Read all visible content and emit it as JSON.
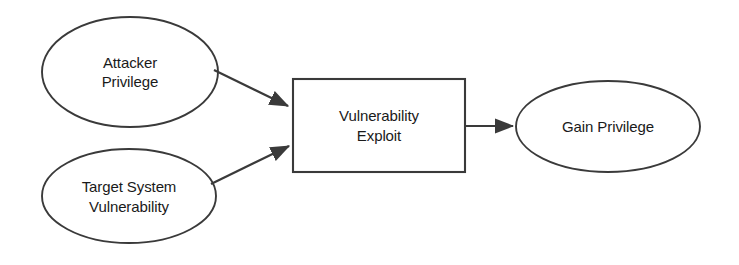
{
  "diagram": {
    "type": "flow-diagram",
    "stroke_color": "#3a3a3a",
    "fill_color": "#ffffff",
    "text_color": "#1a1a1a",
    "nodes": [
      {
        "id": "attacker-privilege",
        "shape": "ellipse",
        "lines": [
          "Attacker",
          "Privilege"
        ],
        "text": "Attacker Privilege"
      },
      {
        "id": "target-system-vulnerability",
        "shape": "ellipse",
        "lines": [
          "Target System",
          "Vulnerability"
        ],
        "text": "Target System Vulnerability"
      },
      {
        "id": "vulnerability-exploit",
        "shape": "rectangle",
        "lines": [
          "Vulnerability",
          "Exploit"
        ],
        "text": "Vulnerability Exploit"
      },
      {
        "id": "gain-privilege",
        "shape": "ellipse",
        "lines": [
          "Gain Privilege"
        ],
        "text": "Gain Privilege"
      }
    ],
    "edges": [
      {
        "id": "attacker-to-exploit",
        "from": "attacker-privilege",
        "to": "vulnerability-exploit",
        "label": ""
      },
      {
        "id": "target-to-exploit",
        "from": "target-system-vulnerability",
        "to": "vulnerability-exploit",
        "label": ""
      },
      {
        "id": "exploit-to-gain",
        "from": "vulnerability-exploit",
        "to": "gain-privilege",
        "label": ""
      }
    ]
  }
}
